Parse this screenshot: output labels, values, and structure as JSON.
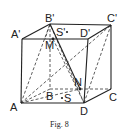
{
  "diagram": {
    "caption": "Fig. 8",
    "labels": {
      "A_prime": "A'",
      "B_prime": "B'",
      "C_prime": "C'",
      "D_prime": "D'",
      "S_prime": "S'",
      "M": "M",
      "N": "N",
      "A": "A",
      "B": "B",
      "C": "C",
      "D": "D",
      "S": "S"
    },
    "vertices": {
      "A_prime": [
        22,
        39
      ],
      "B_prime": [
        50,
        24
      ],
      "C_prime": [
        111,
        25
      ],
      "D_prime": [
        88,
        39
      ],
      "A": [
        21,
        103
      ],
      "B": [
        50,
        89
      ],
      "C": [
        111,
        89
      ],
      "D": [
        84,
        103
      ],
      "M": [
        53,
        39
      ],
      "N": [
        80,
        89
      ],
      "S_prime": [
        67,
        32
      ],
      "S": [
        62,
        98
      ]
    },
    "solid_edges": [
      [
        "A_prime",
        "B_prime"
      ],
      [
        "B_prime",
        "C_prime"
      ],
      [
        "C_prime",
        "D_prime"
      ],
      [
        "D_prime",
        "A_prime"
      ],
      [
        "A_prime",
        "A"
      ],
      [
        "A",
        "D"
      ],
      [
        "D",
        "D_prime"
      ],
      [
        "C_prime",
        "C"
      ],
      [
        "C",
        "D"
      ],
      [
        "B_prime",
        "N"
      ]
    ],
    "dashed_edges": [
      [
        "B_prime",
        "B"
      ],
      [
        "B",
        "A"
      ],
      [
        "B",
        "C"
      ],
      [
        "A",
        "B_prime"
      ],
      [
        "A",
        "N"
      ],
      [
        "A",
        "C_prime"
      ],
      [
        "D",
        "C_prime"
      ],
      [
        "D",
        "B_prime"
      ],
      [
        "M",
        "D"
      ],
      [
        "B_prime",
        "D_prime"
      ]
    ]
  }
}
